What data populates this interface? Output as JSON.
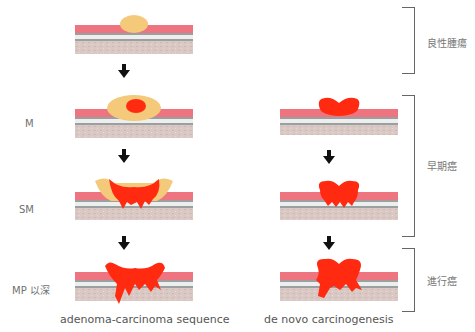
{
  "colors": {
    "mucosa": "#ee7580",
    "submucosa_line": "#9aa0a0",
    "white_band": "#eeeeee",
    "muscle": "#d8c6c2",
    "adenoma": "#f5c97a",
    "carcinoma": "#ff2a10",
    "arrow": "#111111",
    "bracket": "#666666"
  },
  "depth_labels": {
    "m": "M",
    "sm": "SM",
    "mp": "MP 以深"
  },
  "columns": {
    "left": {
      "caption": "adenoma-carcinoma sequence"
    },
    "right": {
      "caption": "de novo carcinogenesis"
    }
  },
  "stages": {
    "benign": "良性腫瘍",
    "early": "早期癌",
    "advanced": "進行癌"
  },
  "icons": {
    "arrow": "down-arrow-icon"
  }
}
